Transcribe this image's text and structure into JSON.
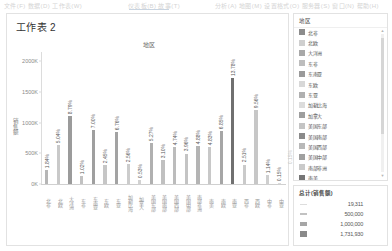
{
  "chrome": {
    "ghost_left": "文件(F) 数据(D) 工作表(W)",
    "ghost_mid": "仪表板(B)  故事(T)",
    "ghost_right": "分析(A)  地图(M)  设置格式(O)  服务器(S)  窗口(N)  帮助(H)"
  },
  "sheet": {
    "title": "工作表 2"
  },
  "legend": {
    "title": "地区",
    "items": [
      {
        "label": "北非",
        "color": "#8c8c8c"
      },
      {
        "label": "北欧",
        "color": "#cfcfcf"
      },
      {
        "label": "大洋洲",
        "color": "#a8a8a8"
      },
      {
        "label": "东非",
        "color": "#bdbdbd"
      },
      {
        "label": "东南亚",
        "color": "#9a9a9a"
      },
      {
        "label": "东欧",
        "color": "#d8d8d8"
      },
      {
        "label": "东亚",
        "color": "#b0b0b0"
      },
      {
        "label": "加勒比海",
        "color": "#dcdcdc"
      },
      {
        "label": "加拿大",
        "color": "#9e9e9e"
      },
      {
        "label": "美国东部",
        "color": "#c4c4c4"
      },
      {
        "label": "美国南部",
        "color": "#8a8a8a"
      },
      {
        "label": "美国西部",
        "color": "#b8b8b8"
      },
      {
        "label": "美国中部",
        "color": "#a0a0a0"
      },
      {
        "label": "南部非洲",
        "color": "#cacaca"
      },
      {
        "label": "南美",
        "color": "#767676"
      },
      {
        "label": "南欧",
        "color": "#c0c0c0"
      },
      {
        "label": "南亚",
        "color": "#8e8e8e"
      }
    ],
    "scroll_up": "▲",
    "scroll_down": "▼"
  },
  "size_legend": {
    "title": "总计(销售额)",
    "values": [
      "19,311",
      "500,000",
      "1,000,000",
      "1,731,930"
    ],
    "marks": [
      {
        "height": 1,
        "color": "#dddddd"
      },
      {
        "height": 2,
        "color": "#c2c2c2"
      },
      {
        "height": 4,
        "color": "#a6a6a6"
      },
      {
        "height": 6,
        "color": "#8a8a8a"
      }
    ]
  },
  "ghost_label": "0.15%",
  "chart_data": {
    "type": "bar",
    "title": "地区",
    "xlabel": "",
    "ylabel": "销售额",
    "ylim": [
      0,
      2150000
    ],
    "yticks": [
      0,
      500000,
      1000000,
      1500000,
      2000000
    ],
    "ytick_labels": [
      "0K",
      "500K",
      "1000K",
      "1500K",
      "2000K"
    ],
    "grid": false,
    "legend_position": "right",
    "categories": [
      "北非",
      "北欧",
      "大洋洲",
      "东非",
      "东南亚",
      "东欧",
      "东亚",
      "加勒比海",
      "加拿大",
      "美国东部",
      "美国南部",
      "美国西部",
      "美国中部",
      "南部非洲",
      "南美",
      "南欧",
      "南亚",
      "西非",
      "西欧",
      "中非",
      "中亚"
    ],
    "data_labels": [
      "1.84%",
      "5.04%",
      "8.79%",
      "1.02%",
      "7.00%",
      "2.45%",
      "6.76%",
      "2.56%",
      "0.53%",
      "5.27%",
      "3.10%",
      "4.74%",
      "3.96%",
      "4.88%",
      "4.83%",
      "6.85%",
      "13.78%",
      "2.51%",
      "9.56%",
      "1.14%",
      "0.15%"
    ],
    "values": [
      231000,
      633000,
      1104000,
      128000,
      879000,
      308000,
      849000,
      321000,
      67000,
      662000,
      389000,
      595000,
      497000,
      613000,
      607000,
      860000,
      1731930,
      315000,
      1201000,
      143000,
      19311
    ],
    "colors": [
      "#b6b6b6",
      "#c9c9c9",
      "#9b9b9b",
      "#c2c2c2",
      "#9f9f9f",
      "#c6c6c6",
      "#a3a3a3",
      "#cccccc",
      "#d2d2d2",
      "#b0b0b0",
      "#c0c0c0",
      "#bcbcbc",
      "#c4c4c4",
      "#b4b4b4",
      "#c8c8c8",
      "#a6a6a6",
      "#707070",
      "#cacaca",
      "#c7c7c7",
      "#cfcfcf",
      "#dcdcdc"
    ]
  }
}
